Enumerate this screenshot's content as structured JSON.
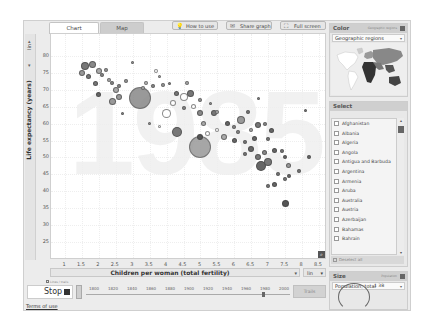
{
  "tabs": [
    {
      "label": "Chart",
      "active": true
    },
    {
      "label": "Map",
      "active": false
    }
  ],
  "toolbar": {
    "how_to_use": "How to use",
    "share_graph": "Share graph",
    "full_screen": "Full screen",
    "how_to_use_icon": "💡",
    "share_graph_icon": "✉",
    "full_screen_icon": "⛶"
  },
  "y_axis": {
    "label": "Life expectancy (years)",
    "scale": "lin",
    "ticks": [
      "80",
      "75",
      "70",
      "65",
      "60",
      "55",
      "50",
      "45",
      "40",
      "35",
      "30",
      "25"
    ]
  },
  "x_axis": {
    "label": "Children per woman (total fertility)",
    "scale": "lin",
    "ticks": [
      "1",
      "1.5",
      "2",
      "2.5",
      "3",
      "3.5",
      "4",
      "4.5",
      "5",
      "5.5",
      "6",
      "6.5",
      "7",
      "7.5",
      "8",
      "8.5"
    ]
  },
  "year_watermark": "1985",
  "playback": {
    "trails_label": "Lines / trails",
    "play_button": "Stop",
    "timeline_labels": [
      "1800",
      "1820",
      "1840",
      "1860",
      "1880",
      "1900",
      "1920",
      "1940",
      "1960",
      "1980",
      "2000"
    ],
    "trails_button": "Trails"
  },
  "footer": {
    "terms": "Terms of use",
    "copyright": "© Google 2008"
  },
  "color_panel": {
    "title": "Color",
    "subtitle": "Geographic regions",
    "selected": "Geographic regions"
  },
  "select_panel": {
    "title": "Select",
    "countries": [
      "Afghanistan",
      "Albania",
      "Algeria",
      "Angola",
      "Antigua and Barbuda",
      "Argentina",
      "Armenia",
      "Aruba",
      "Australia",
      "Austria",
      "Azerbaijan",
      "Bahamas",
      "Bahrain"
    ],
    "deselect_all": "Deselect all"
  },
  "size_panel": {
    "title": "Size",
    "subtitle": "Population",
    "selected": "Population, total",
    "max_value": "1 3B"
  },
  "chart_data": {
    "type": "scatter",
    "title": "1985",
    "xlabel": "Children per woman (total fertility)",
    "ylabel": "Life expectancy (years)",
    "xlim": [
      0.6,
      8.7
    ],
    "ylim": [
      20,
      82
    ],
    "grid": true,
    "legend": "Color: Geographic regions; Size: Population, total",
    "points": [
      {
        "x": 1.6,
        "y": 77,
        "r": 4,
        "c": "#777"
      },
      {
        "x": 1.8,
        "y": 77.5,
        "r": 3.5,
        "c": "#888"
      },
      {
        "x": 1.5,
        "y": 75,
        "r": 3,
        "c": "#999"
      },
      {
        "x": 1.7,
        "y": 74,
        "r": 2.5,
        "c": "#777"
      },
      {
        "x": 2.0,
        "y": 75.5,
        "r": 3,
        "c": "#aaa"
      },
      {
        "x": 2.1,
        "y": 74.5,
        "r": 2,
        "c": "#888"
      },
      {
        "x": 2.2,
        "y": 76,
        "r": 2,
        "c": "#999"
      },
      {
        "x": 1.9,
        "y": 72,
        "r": 2.5,
        "c": "#777"
      },
      {
        "x": 2.3,
        "y": 73,
        "r": 2,
        "c": "#aaa"
      },
      {
        "x": 2.4,
        "y": 72,
        "r": 2,
        "c": "#888"
      },
      {
        "x": 2.5,
        "y": 70,
        "r": 3,
        "c": "#aaa"
      },
      {
        "x": 2.0,
        "y": 68.5,
        "r": 2.5,
        "c": "#666"
      },
      {
        "x": 2.6,
        "y": 68,
        "r": 3,
        "c": "#999"
      },
      {
        "x": 2.6,
        "y": 71,
        "r": 2,
        "c": "#888"
      },
      {
        "x": 2.8,
        "y": 72.5,
        "r": 2,
        "c": "#999"
      },
      {
        "x": 2.4,
        "y": 66.5,
        "r": 3.5,
        "c": "#999"
      },
      {
        "x": 3.2,
        "y": 67.5,
        "r": 11,
        "c": "#888"
      },
      {
        "x": 3.3,
        "y": 70.5,
        "r": 2,
        "c": "#aaa"
      },
      {
        "x": 3.4,
        "y": 72,
        "r": 2,
        "c": "#bbb"
      },
      {
        "x": 3.6,
        "y": 71,
        "r": 2,
        "c": "#888"
      },
      {
        "x": 3.9,
        "y": 71.5,
        "r": 2,
        "c": "#999"
      },
      {
        "x": 3.0,
        "y": 78,
        "r": 1.5,
        "c": "#999"
      },
      {
        "x": 3.7,
        "y": 75.5,
        "r": 2,
        "c": "#fff"
      },
      {
        "x": 3.8,
        "y": 74,
        "r": 1.5,
        "c": "#aaa"
      },
      {
        "x": 4.1,
        "y": 72,
        "r": 1.5,
        "c": "#888"
      },
      {
        "x": 4.3,
        "y": 69,
        "r": 2.5,
        "c": "#777"
      },
      {
        "x": 4.5,
        "y": 68,
        "r": 4,
        "c": "#fff"
      },
      {
        "x": 4.6,
        "y": 72,
        "r": 2,
        "c": "#aaa"
      },
      {
        "x": 4.7,
        "y": 69,
        "r": 3.5,
        "c": "#777"
      },
      {
        "x": 4.2,
        "y": 66,
        "r": 3,
        "c": "#fff"
      },
      {
        "x": 4.0,
        "y": 63,
        "r": 4.5,
        "c": "#fff"
      },
      {
        "x": 4.5,
        "y": 64.5,
        "r": 2,
        "c": "#888"
      },
      {
        "x": 4.8,
        "y": 65,
        "r": 2.5,
        "c": "#fff"
      },
      {
        "x": 5.0,
        "y": 63,
        "r": 3,
        "c": "#888"
      },
      {
        "x": 5.0,
        "y": 67,
        "r": 2,
        "c": "#999"
      },
      {
        "x": 4.3,
        "y": 57.5,
        "r": 5,
        "c": "#777"
      },
      {
        "x": 5.0,
        "y": 53,
        "r": 11,
        "c": "#999"
      },
      {
        "x": 5.0,
        "y": 56,
        "r": 3,
        "c": "#555"
      },
      {
        "x": 5.2,
        "y": 57,
        "r": 2.5,
        "c": "#fff"
      },
      {
        "x": 5.1,
        "y": 60,
        "r": 2.5,
        "c": "#aaa"
      },
      {
        "x": 5.4,
        "y": 63,
        "r": 3,
        "c": "#777"
      },
      {
        "x": 5.3,
        "y": 66,
        "r": 1.5,
        "c": "#999"
      },
      {
        "x": 5.5,
        "y": 63.5,
        "r": 2,
        "c": "#aaa"
      },
      {
        "x": 5.8,
        "y": 60,
        "r": 2.5,
        "c": "#666"
      },
      {
        "x": 5.5,
        "y": 58,
        "r": 2,
        "c": "#fff"
      },
      {
        "x": 5.7,
        "y": 56,
        "r": 3,
        "c": "#aaa"
      },
      {
        "x": 6.0,
        "y": 59,
        "r": 2,
        "c": "#888"
      },
      {
        "x": 6.2,
        "y": 61,
        "r": 4,
        "c": "#999"
      },
      {
        "x": 6.4,
        "y": 63.5,
        "r": 2,
        "c": "#777"
      },
      {
        "x": 6.0,
        "y": 55,
        "r": 2.5,
        "c": "#666"
      },
      {
        "x": 6.1,
        "y": 57.5,
        "r": 2,
        "c": "#888"
      },
      {
        "x": 6.3,
        "y": 54.5,
        "r": 2,
        "c": "#777"
      },
      {
        "x": 6.5,
        "y": 58,
        "r": 2,
        "c": "#aaa"
      },
      {
        "x": 6.6,
        "y": 55.5,
        "r": 2.5,
        "c": "#666"
      },
      {
        "x": 6.7,
        "y": 59.5,
        "r": 3,
        "c": "#777"
      },
      {
        "x": 6.9,
        "y": 60,
        "r": 2,
        "c": "#888"
      },
      {
        "x": 6.3,
        "y": 51,
        "r": 2,
        "c": "#777"
      },
      {
        "x": 6.5,
        "y": 52.5,
        "r": 3,
        "c": "#666"
      },
      {
        "x": 6.7,
        "y": 50,
        "r": 3,
        "c": "#777"
      },
      {
        "x": 6.8,
        "y": 47.5,
        "r": 5,
        "c": "#666"
      },
      {
        "x": 7.0,
        "y": 48.5,
        "r": 4,
        "c": "#777"
      },
      {
        "x": 6.9,
        "y": 51.5,
        "r": 2.5,
        "c": "#888"
      },
      {
        "x": 7.2,
        "y": 52,
        "r": 2.5,
        "c": "#666"
      },
      {
        "x": 7.0,
        "y": 55.5,
        "r": 2,
        "c": "#777"
      },
      {
        "x": 7.1,
        "y": 58,
        "r": 2.5,
        "c": "#666"
      },
      {
        "x": 7.4,
        "y": 52,
        "r": 2,
        "c": "#777"
      },
      {
        "x": 7.5,
        "y": 50,
        "r": 2,
        "c": "#666"
      },
      {
        "x": 7.6,
        "y": 47.5,
        "r": 2.5,
        "c": "#999"
      },
      {
        "x": 7.3,
        "y": 45,
        "r": 2,
        "c": "#777"
      },
      {
        "x": 7.6,
        "y": 44.5,
        "r": 2,
        "c": "#666"
      },
      {
        "x": 7.9,
        "y": 46,
        "r": 2,
        "c": "#777"
      },
      {
        "x": 8.2,
        "y": 50,
        "r": 2,
        "c": "#666"
      },
      {
        "x": 7.2,
        "y": 42,
        "r": 2.5,
        "c": "#666"
      },
      {
        "x": 7.0,
        "y": 41.5,
        "r": 2,
        "c": "#777"
      },
      {
        "x": 7.5,
        "y": 43.5,
        "r": 2,
        "c": "#777"
      },
      {
        "x": 7.5,
        "y": 36.5,
        "r": 3.5,
        "c": "#555"
      },
      {
        "x": 8.1,
        "y": 64,
        "r": 1.5,
        "c": "#777"
      },
      {
        "x": 6.7,
        "y": 67.5,
        "r": 1.5,
        "c": "#888"
      },
      {
        "x": 3.5,
        "y": 60,
        "r": 1.5,
        "c": "#999"
      },
      {
        "x": 2.7,
        "y": 63,
        "r": 1.5,
        "c": "#888"
      },
      {
        "x": 3.8,
        "y": 59,
        "r": 1.5,
        "c": "#fff"
      }
    ]
  }
}
